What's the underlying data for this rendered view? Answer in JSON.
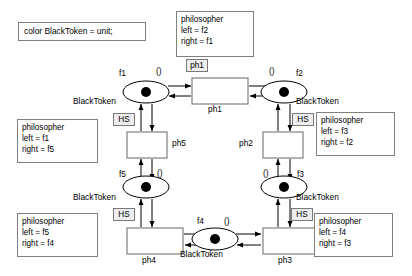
{
  "diagram": {
    "type": "petri-net",
    "title_declaration": "color BlackToken = unit;",
    "arc_inscription": "()",
    "place_color_label": "BlackToken",
    "hs_badge": "HS",
    "places": [
      {
        "id": "f1",
        "label": "f1",
        "tokens": 1,
        "color_label": "BlackToken",
        "x": 146,
        "y": 92
      },
      {
        "id": "f2",
        "label": "f2",
        "tokens": 1,
        "color_label": "BlackToken",
        "x": 284,
        "y": 92
      },
      {
        "id": "f3",
        "label": "f3",
        "tokens": 1,
        "color_label": "BlackToken",
        "x": 284,
        "y": 187
      },
      {
        "id": "f4",
        "label": "f4",
        "tokens": 1,
        "color_label": "BlackToken",
        "x": 215,
        "y": 238
      },
      {
        "id": "f5",
        "label": "f5",
        "tokens": 1,
        "color_label": "BlackToken",
        "x": 146,
        "y": 187
      }
    ],
    "transitions": [
      {
        "id": "ph1",
        "label": "ph1",
        "x": 192,
        "y": 78,
        "w": 56,
        "h": 26
      },
      {
        "id": "ph2",
        "label": "ph2",
        "x": 263,
        "y": 132,
        "w": 40,
        "h": 26
      },
      {
        "id": "ph3",
        "label": "ph3",
        "x": 263,
        "y": 228,
        "w": 56,
        "h": 26
      },
      {
        "id": "ph4",
        "label": "ph4",
        "x": 127,
        "y": 228,
        "w": 56,
        "h": 26
      },
      {
        "id": "ph5",
        "label": "ph5",
        "x": 127,
        "y": 132,
        "w": 40,
        "h": 26
      }
    ],
    "declaration_box": {
      "text": "color BlackToken = unit;",
      "x": 18,
      "y": 22,
      "w": 128,
      "h": 19
    },
    "philosopher_boxes": [
      {
        "id": "phil-ph1",
        "title": "philosopher",
        "left": "left = f2",
        "right": "right = f1",
        "x": 176,
        "y": 11,
        "w": 78,
        "h": 46
      },
      {
        "id": "phil-ph5",
        "title": "philosopher",
        "left": "left = f1",
        "right": "right = f5",
        "x": 17,
        "y": 119,
        "w": 81,
        "h": 43
      },
      {
        "id": "phil-ph2",
        "title": "philosopher",
        "left": "left = f3",
        "right": "right = f2",
        "x": 316,
        "y": 112,
        "w": 79,
        "h": 44
      },
      {
        "id": "phil-ph4",
        "title": "philosopher",
        "left": "left = f5",
        "right": "right = f4",
        "x": 17,
        "y": 213,
        "w": 81,
        "h": 44
      },
      {
        "id": "phil-ph3",
        "title": "philosopher",
        "left": "left = f4",
        "right": "right = f3",
        "x": 314,
        "y": 213,
        "w": 79,
        "h": 44
      }
    ],
    "hs_badges": [
      {
        "for": "ph1",
        "x": 186,
        "y": 59,
        "w": 22,
        "h": 13
      },
      {
        "for": "ph5",
        "x": 113,
        "y": 113,
        "w": 22,
        "h": 13
      },
      {
        "for": "ph2",
        "x": 292,
        "y": 113,
        "w": 22,
        "h": 13
      },
      {
        "for": "ph4",
        "x": 113,
        "y": 208,
        "w": 22,
        "h": 13
      },
      {
        "for": "ph3",
        "x": 291,
        "y": 208,
        "w": 22,
        "h": 13
      }
    ],
    "place_name_labels": [
      {
        "text": "f1",
        "x": 119,
        "y": 68
      },
      {
        "text": "f2",
        "x": 296,
        "y": 68
      },
      {
        "text": "f3",
        "x": 297,
        "y": 169
      },
      {
        "text": "f4",
        "x": 197,
        "y": 216
      },
      {
        "text": "f5",
        "x": 119,
        "y": 169
      }
    ],
    "blacktoken_labels": [
      {
        "text": "BlackToken",
        "x": 73,
        "y": 96
      },
      {
        "text": "BlackToken",
        "x": 296,
        "y": 96
      },
      {
        "text": "BlackToken",
        "x": 296,
        "y": 192
      },
      {
        "text": "BlackToken",
        "x": 180,
        "y": 244
      },
      {
        "text": "BlackToken",
        "x": 73,
        "y": 192
      }
    ],
    "inscription_labels": [
      {
        "text": "()",
        "x": 156,
        "y": 67
      },
      {
        "text": "()",
        "x": 269,
        "y": 67
      },
      {
        "text": "()",
        "x": 265,
        "y": 169
      },
      {
        "text": "()",
        "x": 221,
        "y": 215
      },
      {
        "text": "()",
        "x": 157,
        "y": 169
      }
    ],
    "transition_name_labels": [
      {
        "text": "ph1",
        "x": 208,
        "y": 105
      },
      {
        "text": "ph2",
        "x": 239,
        "y": 138
      },
      {
        "text": "ph3",
        "x": 278,
        "y": 255
      },
      {
        "text": "ph4",
        "x": 142,
        "y": 255
      },
      {
        "text": "ph5",
        "x": 172,
        "y": 138
      }
    ],
    "colors": {
      "background": "#ffffff",
      "stroke": "#000000",
      "box_border": "#808080",
      "transition_border": "#666666",
      "badge_fill": "#ededed",
      "token": "#000000"
    }
  }
}
